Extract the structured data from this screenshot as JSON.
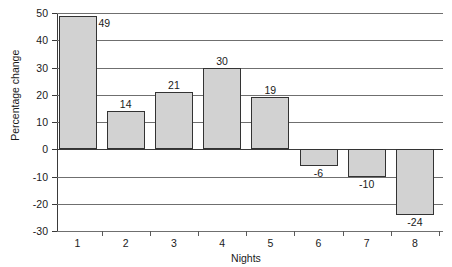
{
  "chart_data": {
    "type": "bar",
    "title": "",
    "xlabel": "Nights",
    "ylabel": "Percentage change",
    "categories": [
      "1",
      "2",
      "3",
      "4",
      "5",
      "6",
      "7",
      "8"
    ],
    "values": [
      49,
      14,
      21,
      30,
      19,
      -6,
      -10,
      -24
    ],
    "data_labels": [
      "49",
      "14",
      "21",
      "30",
      "19",
      "-6",
      "-10",
      "-24"
    ],
    "ylim": [
      -30,
      50
    ],
    "yticks": [
      50,
      40,
      30,
      20,
      10,
      0,
      -10,
      -20,
      -30
    ],
    "ytick_labels": [
      "50",
      "40",
      "30",
      "20",
      "10",
      "0",
      "-10",
      "-20",
      "-30"
    ],
    "grid": true,
    "grid_axis": "y",
    "legend": null,
    "bar_fill_color": "#d2d2d2",
    "bar_edge_color": "#333333",
    "gridline_color": "#6f6f6f",
    "axis_color": "#3a3a3a",
    "background_color": "#ffffff"
  }
}
